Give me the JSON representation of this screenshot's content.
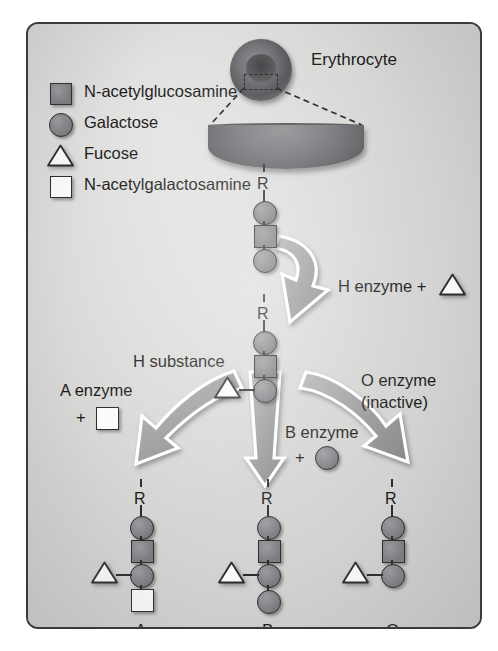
{
  "figure": {
    "type": "biology-pathway-diagram"
  },
  "colors": {
    "panel_background": "#d6d6d4",
    "panel_border": "#3a3a3a",
    "sugar_gray": "#86868a",
    "sugar_white": "#fbfbfb",
    "outline": "#2b2b2b",
    "arrow_gray": "#9a9a9c",
    "arrow_outline": "#ffffff",
    "text": "#1a1a1a"
  },
  "legend": {
    "items": [
      {
        "symbol": "gray-square",
        "label": "N-acetylglucosamine"
      },
      {
        "symbol": "gray-circle",
        "label": "Galactose"
      },
      {
        "symbol": "white-triangle",
        "label": "Fucose"
      },
      {
        "symbol": "white-square",
        "label": "N-acetylgalactosamine"
      }
    ]
  },
  "cell": {
    "label": "Erythrocyte",
    "icon": "erythrocyte-icon",
    "callout": "dashed-magnification-callout",
    "membrane": "membrane-lens-icon"
  },
  "chains": {
    "precursor": {
      "name": "precursor-chain",
      "root_label": "R",
      "units": [
        "gray-circle",
        "gray-square",
        "gray-circle"
      ],
      "branch": null
    },
    "h_substance": {
      "name": "h-substance-chain",
      "caption": "H substance",
      "root_label": "R",
      "units": [
        "gray-circle",
        "gray-square",
        "gray-circle"
      ],
      "branch": {
        "symbol": "white-triangle",
        "attached_to": 3,
        "side": "left"
      },
      "terminal": null
    },
    "type_a": {
      "name": "type-a-chain",
      "label": "A",
      "root_label": "R",
      "units": [
        "gray-circle",
        "gray-square",
        "gray-circle"
      ],
      "branch": {
        "symbol": "white-triangle",
        "attached_to": 3,
        "side": "left"
      },
      "terminal": "white-square"
    },
    "type_b": {
      "name": "type-b-chain",
      "label": "B",
      "root_label": "R",
      "units": [
        "gray-circle",
        "gray-square",
        "gray-circle"
      ],
      "branch": {
        "symbol": "white-triangle",
        "attached_to": 3,
        "side": "left"
      },
      "terminal": "gray-circle"
    },
    "type_o": {
      "name": "type-o-chain",
      "label": "O",
      "root_label": "R",
      "units": [
        "gray-circle",
        "gray-square",
        "gray-circle"
      ],
      "branch": {
        "symbol": "white-triangle",
        "attached_to": 3,
        "side": "left"
      },
      "terminal": null
    }
  },
  "reactions": {
    "h": {
      "name": "h-enzyme-step",
      "label": "H enzyme +",
      "substrate_symbol": "white-triangle",
      "arrow": "curved-arrow-down-right"
    },
    "a": {
      "name": "a-enzyme-step",
      "label": "A enzyme",
      "plus": "+",
      "substrate_symbol": "white-square",
      "arrow": "curved-arrow-down-left"
    },
    "b": {
      "name": "b-enzyme-step",
      "label": "B enzyme",
      "plus": "+",
      "substrate_symbol": "gray-circle",
      "arrow": "straight-arrow-down"
    },
    "o": {
      "name": "o-enzyme-step",
      "label_line1": "O enzyme",
      "label_line2": "(inactive)",
      "substrate_symbol": null,
      "arrow": "curved-arrow-down-right"
    }
  }
}
